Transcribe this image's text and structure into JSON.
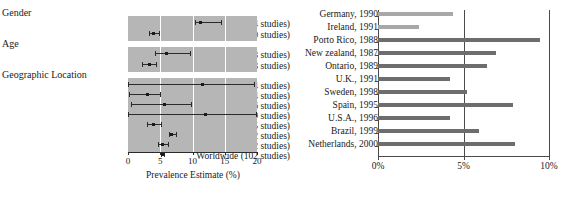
{
  "chart_data": [
    {
      "type": "scatter",
      "id": "forest-plot",
      "title": "",
      "xlabel": "Prevalence Estimate (%)",
      "ylabel": "",
      "xlim": [
        0,
        20
      ],
      "xticks": [
        "0",
        "5",
        "10",
        "15",
        "20"
      ],
      "xtick_values": [
        0,
        5,
        10,
        15,
        20
      ],
      "grid": true,
      "groups": [
        {
          "heading": "Gender",
          "rows": [
            {
              "label": "Male (44 studies)",
              "estimate": 11.3,
              "ci_low": 10.4,
              "ci_high": 14.4
            },
            {
              "label": "Female (40 studies)",
              "estimate": 4.0,
              "ci_low": 3.2,
              "ci_high": 4.8
            }
          ]
        },
        {
          "heading": "Age",
          "rows": [
            {
              "label": "Children (43 studies)",
              "estimate": 6.0,
              "ci_low": 4.2,
              "ci_high": 9.6
            },
            {
              "label": "Adolescents (23 studies)",
              "estimate": 3.3,
              "ci_low": 2.2,
              "ci_high": 4.4
            }
          ]
        },
        {
          "heading": "Geographic Location",
          "rows": [
            {
              "label": "Africa (4 studies)",
              "estimate": 11.5,
              "ci_low": 0.0,
              "ci_high": 19.6
            },
            {
              "label": "Middle East (4 studies)",
              "estimate": 3.0,
              "ci_low": 0.2,
              "ci_high": 5.0
            },
            {
              "label": "Oceania (6 studies)",
              "estimate": 5.7,
              "ci_low": 0.5,
              "ci_high": 9.7
            },
            {
              "label": "South America (9 studies)",
              "estimate": 12.0,
              "ci_low": 0.0,
              "ci_high": 19.9
            },
            {
              "label": "Asia (15 studies)",
              "estimate": 4.0,
              "ci_low": 3.0,
              "ci_high": 5.1
            },
            {
              "label": "North America (32 studies)",
              "estimate": 6.8,
              "ci_low": 6.3,
              "ci_high": 7.4
            },
            {
              "label": "Europe (32 studies)",
              "estimate": 5.4,
              "ci_low": 4.6,
              "ci_high": 6.2
            },
            {
              "label": "Worldwide (102 studies)",
              "estimate": 5.3,
              "ci_low": 5.1,
              "ci_high": 5.6
            }
          ]
        }
      ]
    },
    {
      "type": "bar",
      "id": "country-prevalence-bars",
      "orientation": "horizontal",
      "title": "",
      "xlabel": "",
      "ylabel": "",
      "xlim": [
        0,
        10
      ],
      "xticks": [
        "0%",
        "5%",
        "10%"
      ],
      "xtick_values": [
        0,
        5,
        10
      ],
      "grid": true,
      "categories": [
        "Germany, 1990",
        "Ireland, 1991",
        "Porto Rico, 1988",
        "New zealand, 1987",
        "Ontario, 1989",
        "U.K., 1991",
        "Sweden, 1998",
        "Spain, 1995",
        "U.S.A., 1996",
        "Brazil, 1999",
        "Netherlands, 2000"
      ],
      "values": [
        4.4,
        2.4,
        9.5,
        6.9,
        6.4,
        4.2,
        5.2,
        7.9,
        4.2,
        5.9,
        8.0
      ],
      "bar_colors": [
        "#a8a8a8",
        "#a8a8a8",
        "#6d6d6d",
        "#6d6d6d",
        "#6d6d6d",
        "#6d6d6d",
        "#6d6d6d",
        "#6d6d6d",
        "#6d6d6d",
        "#6d6d6d",
        "#6d6d6d"
      ]
    }
  ],
  "colors": {
    "panel_background": "#b6b6b6",
    "gridline": "#ffffff",
    "marker": "#1a1a1a",
    "axis": "#4a4a4a",
    "bar_light": "#a8a8a8",
    "bar_dark": "#6d6d6d"
  }
}
